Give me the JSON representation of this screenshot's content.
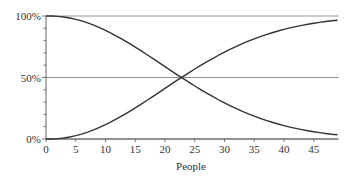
{
  "chart_data": {
    "type": "line",
    "title": "",
    "xlabel": "People",
    "ylabel": "",
    "xlim": [
      0,
      49
    ],
    "ylim": [
      0,
      100
    ],
    "x_ticks": [
      0,
      5,
      10,
      15,
      20,
      25,
      30,
      35,
      40,
      45
    ],
    "y_ticks": [
      "0%",
      "50%",
      "100%"
    ],
    "y_tick_values": [
      0,
      50,
      100
    ],
    "grid": "horizontal at 0%, 50%, 100%",
    "legend": null,
    "x": [
      0,
      1,
      2,
      3,
      4,
      5,
      6,
      7,
      8,
      9,
      10,
      11,
      12,
      13,
      14,
      15,
      16,
      17,
      18,
      19,
      20,
      21,
      22,
      23,
      24,
      25,
      26,
      27,
      28,
      29,
      30,
      31,
      32,
      33,
      34,
      35,
      36,
      37,
      38,
      39,
      40,
      41,
      42,
      43,
      44,
      45,
      46,
      47,
      48,
      49
    ],
    "series": [
      {
        "name": "Probability of a shared birthday",
        "values": [
          0,
          0,
          0.3,
          0.8,
          1.6,
          2.7,
          4.0,
          5.6,
          7.4,
          9.5,
          11.7,
          14.1,
          16.7,
          19.4,
          22.3,
          25.3,
          28.4,
          31.5,
          34.7,
          37.9,
          41.1,
          44.4,
          47.6,
          50.7,
          53.8,
          56.9,
          59.8,
          62.7,
          65.4,
          68.1,
          70.6,
          73.0,
          75.3,
          77.5,
          79.5,
          81.4,
          83.2,
          84.9,
          86.4,
          87.8,
          89.1,
          90.3,
          91.4,
          92.4,
          93.3,
          94.1,
          94.8,
          95.5,
          96.1,
          96.5
        ]
      },
      {
        "name": "Probability of no shared birthday",
        "values": [
          100,
          100,
          99.7,
          99.2,
          98.4,
          97.3,
          96.0,
          94.4,
          92.6,
          90.5,
          88.3,
          85.9,
          83.3,
          80.6,
          77.7,
          74.7,
          71.6,
          68.5,
          65.3,
          62.1,
          58.9,
          55.6,
          52.4,
          49.3,
          46.2,
          43.1,
          40.2,
          37.3,
          34.6,
          31.9,
          29.4,
          27.0,
          24.7,
          22.5,
          20.5,
          18.6,
          16.8,
          15.1,
          13.6,
          12.2,
          10.9,
          9.7,
          8.6,
          7.6,
          6.7,
          5.9,
          5.2,
          4.5,
          3.9,
          3.5
        ]
      }
    ],
    "annotations": []
  },
  "colors": {
    "curve": "#333333",
    "gridline": "#888888",
    "axis": "#555555",
    "text": "#333333"
  }
}
